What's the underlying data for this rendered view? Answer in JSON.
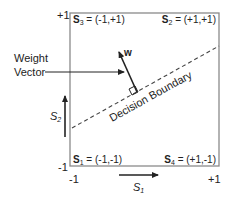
{
  "diagram": {
    "colors": {
      "box_stroke": "#8a8a8a",
      "ink": "#222222",
      "background": "#ffffff"
    },
    "corners": {
      "top_left": {
        "name": "S",
        "sub": "3",
        "value": " = (-1,+1)"
      },
      "top_right": {
        "name": "S",
        "sub": "2",
        "value": " = (+1,+1)"
      },
      "bottom_left": {
        "name": "S",
        "sub": "1",
        "value": " = (-1,-1)"
      },
      "bottom_right": {
        "name": "S",
        "sub": "4",
        "value": " = (+1,-1)"
      }
    },
    "ticks": {
      "y_top": "+1",
      "y_bottom": "-1",
      "x_left": "-1",
      "x_right": "+1"
    },
    "axes": {
      "x_label": "S",
      "x_sub": "1",
      "y_label": "S",
      "y_sub": "2"
    },
    "weight_vector": {
      "label_line1": "Weight",
      "label_line2": "Vector",
      "symbol": "w"
    },
    "decision_boundary": {
      "label": "Decision Boundary"
    }
  }
}
